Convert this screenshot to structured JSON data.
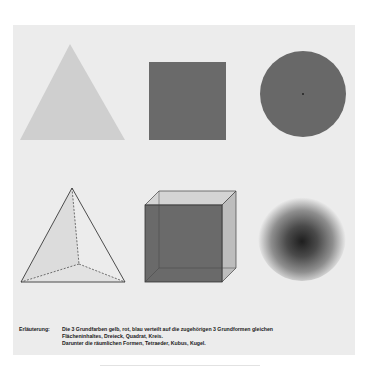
{
  "figure": {
    "background_color": "#ececec",
    "shapes_2d": [
      {
        "name": "Dreieck",
        "color_word": "gelb",
        "fill": "#cfcfcf"
      },
      {
        "name": "Quadrat",
        "color_word": "rot",
        "fill": "#6a6a6a"
      },
      {
        "name": "Kreis",
        "color_word": "blau",
        "fill": "#686868"
      }
    ],
    "shapes_3d": [
      {
        "name": "Tetraeder"
      },
      {
        "name": "Kubus"
      },
      {
        "name": "Kugel"
      }
    ]
  },
  "caption": {
    "label": "Erläuterung:",
    "lines": [
      "Die 3 Grundfarben gelb, rot, blau verteilt auf die zugehörigen 3 Grundformen gleichen",
      "Flächeninhaltes, Dreieck, Quadrat, Kreis.",
      "Darunter die räumlichen Formen, Tetraeder, Kubus, Kugel."
    ]
  }
}
